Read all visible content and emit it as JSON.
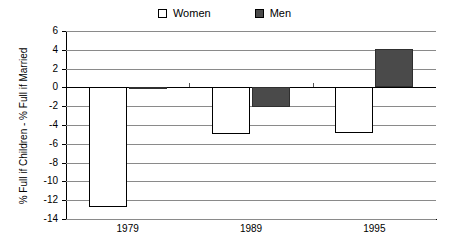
{
  "chart_data": {
    "type": "bar",
    "title": "",
    "xlabel": "",
    "ylabel": "% Full if Children - % Full if Married",
    "categories": [
      "1979",
      "1989",
      "1995"
    ],
    "series": [
      {
        "name": "Women",
        "color": "#ffffff",
        "values": [
          -12.7,
          -5.0,
          -4.8
        ]
      },
      {
        "name": "Men",
        "color": "#4a4a4a",
        "values": [
          -0.2,
          -2.1,
          4.1
        ]
      }
    ],
    "ylim": [
      -14,
      6
    ],
    "ytick_step": 2,
    "yticks": [
      "6",
      "4",
      "2",
      "0",
      "-2",
      "-4",
      "-6",
      "-8",
      "-10",
      "-12",
      "-14"
    ],
    "grid": true,
    "legend_position": "top"
  },
  "legend": {
    "entries": [
      {
        "label": "Women",
        "swatch": "hollow-square-icon"
      },
      {
        "label": "Men",
        "swatch": "filled-square-icon"
      }
    ]
  },
  "axes": {
    "y_title": "% Full if Children - % Full if Married",
    "x_labels": [
      "1979",
      "1989",
      "1995"
    ]
  }
}
